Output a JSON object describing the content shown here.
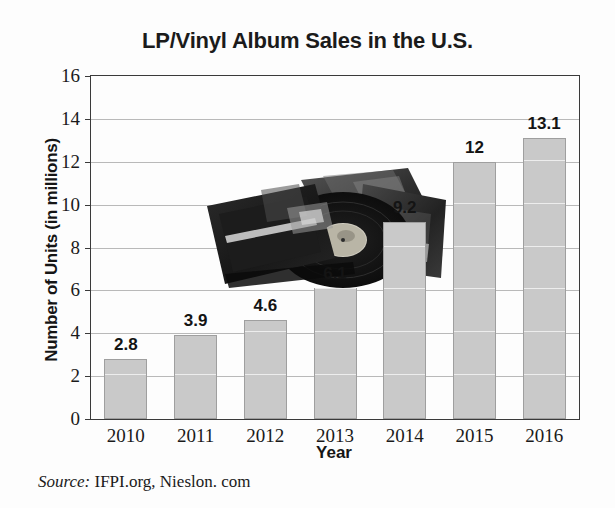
{
  "chart_data": {
    "type": "bar",
    "title": "LP/Vinyl Album Sales in the U.S.",
    "xlabel": "Year",
    "ylabel": "Number of Units (in millions)",
    "categories": [
      "2010",
      "2011",
      "2012",
      "2013",
      "2014",
      "2015",
      "2016"
    ],
    "values": [
      2.8,
      3.9,
      4.6,
      6.1,
      9.2,
      12,
      13.1
    ],
    "value_labels": [
      "2.8",
      "3.9",
      "4.6",
      "6.1",
      "9.2",
      "12",
      "13.1"
    ],
    "ylim": [
      0,
      16
    ],
    "ytick_labels": [
      "0",
      "2",
      "4",
      "6",
      "8",
      "10",
      "12",
      "14",
      "16"
    ],
    "ytick_values": [
      0,
      2,
      4,
      6,
      8,
      10,
      12,
      14,
      16
    ],
    "grid": true,
    "legend": "none",
    "bar_color": "#c9c9c9",
    "bar_edge_color": "#9f9f9f",
    "axis_color": "#3a3a3a",
    "gridline_color": "#b9b9b9",
    "text_color": "#141414"
  },
  "source": {
    "label": "Source:",
    "text": "IFPI.org, Nieslon. com"
  },
  "overlay": {
    "image_name": "vinyl-records-photo",
    "description": "Photograph of stacked LP album sleeves with a vinyl record"
  }
}
